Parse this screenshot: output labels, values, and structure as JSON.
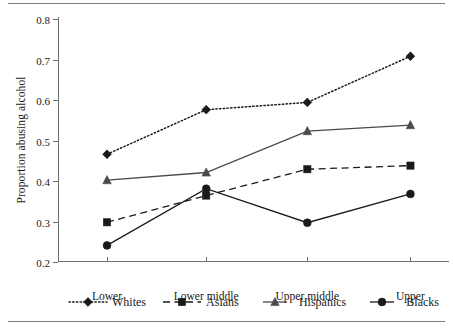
{
  "chart_data": {
    "type": "line",
    "title": "",
    "subtitle": "",
    "xlabel": "",
    "ylabel": "Proportion abusing alcohol",
    "categories": [
      "Lower",
      "Lower middle",
      "Upper middle",
      "Upper"
    ],
    "ylim": [
      0.2,
      0.8
    ],
    "yticks": [
      "0.2",
      "0.3",
      "0.4",
      "0.5",
      "0.6",
      "0.7",
      "0.8"
    ],
    "ytick_values": [
      0.2,
      0.3,
      0.4,
      0.5,
      0.6,
      0.7,
      0.8
    ],
    "grid": false,
    "legend_position": "bottom",
    "series": [
      {
        "name": "Whites",
        "values": [
          0.466,
          0.576,
          0.594,
          0.708
        ],
        "line_style": "dotted",
        "marker": "diamond",
        "color": "#1a1a1a"
      },
      {
        "name": "Asians",
        "values": [
          0.298,
          0.364,
          0.429,
          0.438
        ],
        "line_style": "dashed",
        "marker": "square",
        "color": "#1a1a1a"
      },
      {
        "name": "Hispanics",
        "values": [
          0.402,
          0.421,
          0.523,
          0.538
        ],
        "line_style": "solid",
        "marker": "triangle",
        "color": "#4a4a4a"
      },
      {
        "name": "Blacks",
        "values": [
          0.241,
          0.381,
          0.297,
          0.368
        ],
        "line_style": "solid",
        "marker": "circle",
        "color": "#1a1a1a"
      }
    ]
  },
  "axis": {
    "ylabel": "Proportion abusing alcohol",
    "ytick_0": "0.2",
    "ytick_1": "0.3",
    "ytick_2": "0.4",
    "ytick_3": "0.5",
    "ytick_4": "0.6",
    "ytick_5": "0.7",
    "ytick_6": "0.8",
    "xtick_0": "Lower",
    "xtick_1": "Lower middle",
    "xtick_2": "Upper middle",
    "xtick_3": "Upper"
  },
  "legend": {
    "items": [
      {
        "label": "Whites"
      },
      {
        "label": "Asians"
      },
      {
        "label": "Hispanics"
      },
      {
        "label": "Blacks"
      }
    ]
  },
  "colors": {
    "axis": "#6e6e6e",
    "rule": "#7d7d7d",
    "ink": "#1a1a1a",
    "hispanic_line": "#4a4a4a"
  }
}
